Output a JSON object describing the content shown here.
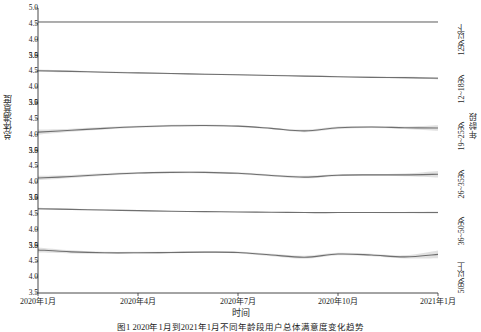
{
  "chart_data": {
    "type": "line",
    "title": "",
    "xlabel": "时间",
    "ylabel": "总体满意度",
    "right_axis_label": "年龄段",
    "ylim": [
      3.5,
      5.0
    ],
    "yticks": [
      "3.5",
      "4.0",
      "4.5",
      "5.0"
    ],
    "xticks": [
      "2020年1月",
      "2020年4月",
      "2020年7月",
      "2020年10月",
      "2021年1月"
    ],
    "x": [
      0,
      1,
      2,
      3,
      4,
      5,
      6,
      7,
      8,
      9,
      10,
      11,
      12
    ],
    "grid": false,
    "legend_position": "right-strip",
    "band_label": "95%置信区间",
    "line_color": "#6f6f6f",
    "band_color": "#c9c9c9",
    "panels": [
      {
        "label": "12岁以下",
        "values": [
          4.56,
          4.56,
          4.56,
          4.56,
          4.56,
          4.56,
          4.56,
          4.56,
          4.56,
          4.56,
          4.56,
          4.56,
          4.56
        ],
        "band_low": [
          4.54,
          4.54,
          4.54,
          4.54,
          4.54,
          4.54,
          4.54,
          4.54,
          4.54,
          4.54,
          4.54,
          4.54,
          4.54
        ],
        "band_high": [
          4.58,
          4.58,
          4.58,
          4.58,
          4.58,
          4.58,
          4.58,
          4.58,
          4.58,
          4.58,
          4.58,
          4.58,
          4.58
        ]
      },
      {
        "label": "12~18岁",
        "values": [
          4.52,
          4.5,
          4.47,
          4.45,
          4.43,
          4.41,
          4.39,
          4.37,
          4.35,
          4.33,
          4.31,
          4.3,
          4.28
        ],
        "band_low": [
          4.48,
          4.47,
          4.45,
          4.43,
          4.41,
          4.39,
          4.37,
          4.35,
          4.33,
          4.31,
          4.29,
          4.27,
          4.24
        ],
        "band_high": [
          4.56,
          4.53,
          4.5,
          4.47,
          4.45,
          4.43,
          4.41,
          4.39,
          4.37,
          4.35,
          4.34,
          4.33,
          4.32
        ]
      },
      {
        "label": "19~25岁",
        "values": [
          4.08,
          4.14,
          4.2,
          4.25,
          4.28,
          4.29,
          4.27,
          4.2,
          4.12,
          4.22,
          4.24,
          4.22,
          4.21
        ],
        "band_low": [
          4.0,
          4.09,
          4.16,
          4.22,
          4.25,
          4.26,
          4.24,
          4.17,
          4.08,
          4.18,
          4.21,
          4.18,
          4.12
        ],
        "band_high": [
          4.16,
          4.19,
          4.24,
          4.28,
          4.31,
          4.32,
          4.3,
          4.23,
          4.16,
          4.26,
          4.27,
          4.26,
          4.3
        ]
      },
      {
        "label": "26~35岁",
        "values": [
          4.13,
          4.18,
          4.24,
          4.29,
          4.31,
          4.31,
          4.28,
          4.21,
          4.16,
          4.22,
          4.23,
          4.23,
          4.25
        ],
        "band_low": [
          4.06,
          4.13,
          4.2,
          4.26,
          4.28,
          4.28,
          4.25,
          4.18,
          4.12,
          4.19,
          4.2,
          4.19,
          4.15
        ],
        "band_high": [
          4.2,
          4.23,
          4.28,
          4.32,
          4.34,
          4.34,
          4.31,
          4.24,
          4.2,
          4.25,
          4.26,
          4.27,
          4.35
        ]
      },
      {
        "label": "36~50岁",
        "values": [
          4.66,
          4.64,
          4.62,
          4.6,
          4.58,
          4.57,
          4.56,
          4.55,
          4.54,
          4.54,
          4.54,
          4.54,
          4.54
        ],
        "band_low": [
          4.63,
          4.62,
          4.6,
          4.58,
          4.57,
          4.56,
          4.55,
          4.54,
          4.53,
          4.53,
          4.53,
          4.52,
          4.51
        ],
        "band_high": [
          4.69,
          4.66,
          4.64,
          4.62,
          4.59,
          4.58,
          4.57,
          4.56,
          4.55,
          4.55,
          4.55,
          4.56,
          4.57
        ]
      },
      {
        "label": "50岁以上",
        "values": [
          4.86,
          4.8,
          4.77,
          4.77,
          4.78,
          4.79,
          4.78,
          4.7,
          4.63,
          4.73,
          4.7,
          4.64,
          4.72
        ],
        "band_low": [
          4.78,
          4.75,
          4.74,
          4.74,
          4.75,
          4.76,
          4.75,
          4.66,
          4.58,
          4.69,
          4.66,
          4.59,
          4.6
        ],
        "band_high": [
          4.94,
          4.85,
          4.8,
          4.8,
          4.81,
          4.82,
          4.81,
          4.74,
          4.68,
          4.77,
          4.74,
          4.69,
          4.84
        ]
      }
    ]
  },
  "figure": {
    "caption": "图1  2020年1月到2021年1月不同年龄段用户总体满意度变化趋势"
  }
}
